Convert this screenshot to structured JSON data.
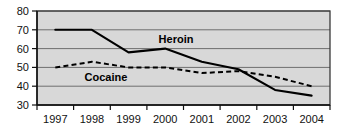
{
  "chart_data": {
    "type": "line",
    "title": "",
    "subtitle": "",
    "xlabel": "",
    "ylabel": "",
    "categories": [
      "1997",
      "1998",
      "1999",
      "2000",
      "2001",
      "2002",
      "2003",
      "2004"
    ],
    "ylim": [
      30,
      80
    ],
    "yticks": [
      30,
      40,
      50,
      60,
      70,
      80
    ],
    "grid": "horizontal",
    "legend": "inline-labels",
    "plot_background": "#d8d8d8",
    "series": [
      {
        "name": "Heroin",
        "style": "solid",
        "color": "#000000",
        "values": [
          70,
          70,
          58,
          60,
          53,
          49,
          38,
          35
        ],
        "label_text": "Heroin"
      },
      {
        "name": "Cocaine",
        "style": "dashed",
        "color": "#000000",
        "values": [
          50,
          53,
          50,
          50,
          47,
          48,
          45,
          40
        ],
        "label_text": "Cocaine"
      }
    ]
  },
  "axis": {
    "y_labels": [
      "80",
      "70",
      "60",
      "50",
      "40",
      "30"
    ],
    "x_labels": [
      "1997",
      "1998",
      "1999",
      "2000",
      "2001",
      "2002",
      "2003",
      "2004"
    ]
  },
  "annotations": {
    "heroin_label": "Heroin",
    "cocaine_label": "Cocaine"
  }
}
